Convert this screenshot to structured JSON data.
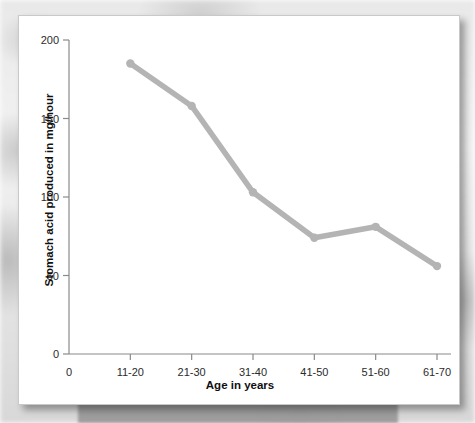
{
  "chart_data": {
    "type": "line",
    "title": "",
    "xlabel": "Age in years",
    "ylabel": "Stomach acid produced in mg/hour",
    "categories": [
      "11-20",
      "21-30",
      "31-40",
      "41-50",
      "51-60",
      "61-70"
    ],
    "values": [
      185,
      158,
      103,
      74,
      81,
      56
    ],
    "xtick_labels": [
      "0",
      "11-20",
      "21-30",
      "31-40",
      "41-50",
      "51-60",
      "61-70"
    ],
    "ytick_labels": [
      "0",
      "50",
      "100",
      "150",
      "200"
    ],
    "ytick_values": [
      0,
      50,
      100,
      150,
      200
    ],
    "ylim": [
      0,
      200
    ],
    "grid": false,
    "legend": false,
    "series_color": "#b4b4b4",
    "marker": "circle",
    "axis_color": "#8a8a8a",
    "text_color": "#101010"
  },
  "card": {
    "background": "#ffffff",
    "border_color": "#c9c9c9"
  }
}
